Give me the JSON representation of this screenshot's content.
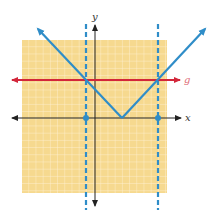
{
  "figure": {
    "axes": {
      "x_label": "x",
      "y_label": "y"
    },
    "grid": {
      "x_min": -10,
      "x_max": 10,
      "y_min": -10,
      "y_max": 11,
      "background": "#f6d98f",
      "line_color": "#ffffff"
    },
    "function_f": {
      "expression": "|x - 4|",
      "vertex": [
        4,
        0
      ],
      "color": "#2f8dc8"
    },
    "function_g": {
      "label": "g",
      "expression": "5",
      "color": "#d3263a"
    },
    "intersections": [
      {
        "x": -1,
        "y": 5
      },
      {
        "x": 9,
        "y": 5
      }
    ],
    "dashed_lines": [
      {
        "x": -1
      },
      {
        "x": 9
      }
    ],
    "marked_points": [
      {
        "x": -1,
        "y": 0
      },
      {
        "x": 9,
        "y": 0
      }
    ]
  }
}
